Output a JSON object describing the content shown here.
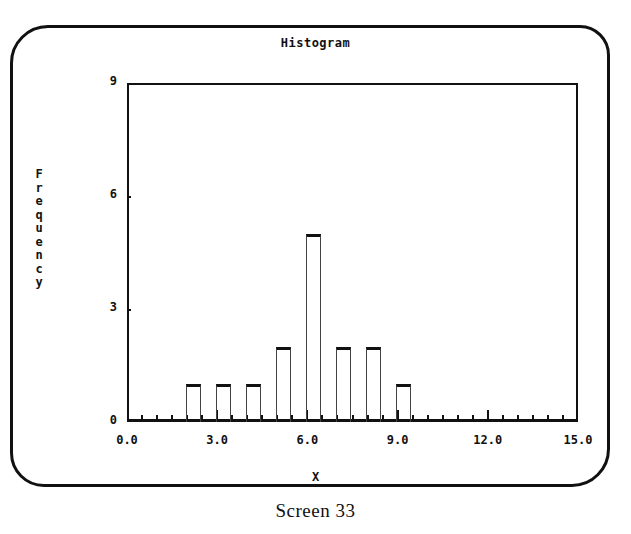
{
  "chart_data": {
    "type": "bar",
    "title": "Histogram",
    "xlabel": "X",
    "ylabel": "Frequency",
    "xlim": [
      0.0,
      15.0
    ],
    "ylim": [
      0,
      9
    ],
    "x_ticks": [
      "0.0",
      "3.0",
      "6.0",
      "9.0",
      "12.0",
      "15.0"
    ],
    "y_ticks": [
      "0",
      "3",
      "6",
      "9"
    ],
    "bin_width": 0.5,
    "categories": [
      "2.2",
      "3.2",
      "4.2",
      "5.2",
      "6.2",
      "7.2",
      "8.2",
      "9.2"
    ],
    "values": [
      1,
      1,
      1,
      2,
      5,
      2,
      2,
      1
    ],
    "grid": false,
    "legend": "none"
  },
  "screen": {
    "title": "Histogram",
    "ylabel": "Frequency",
    "xlabel": "X",
    "caption": "Screen 33"
  }
}
